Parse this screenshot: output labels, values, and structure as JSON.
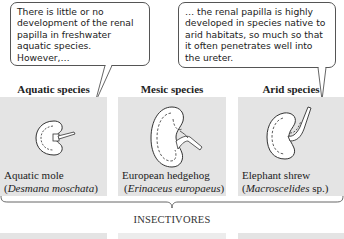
{
  "callouts": [
    {
      "text": "There is little or no development of the renal papilla in freshwater aquatic species.  However,…"
    },
    {
      "text": "… the renal papilla is highly developed in species native to arid habitats, so much so that it often penetrates well into the ureter."
    }
  ],
  "columns": [
    {
      "heading": "Aquatic species",
      "common_name": "Aquatic mole",
      "scientific_name": "Desmana moschata",
      "sci_suffix": ""
    },
    {
      "heading": "Mesic species",
      "common_name": "European hedgehog",
      "scientific_name": "Erinaceus europaeus",
      "sci_suffix": ""
    },
    {
      "heading": "Arid species",
      "common_name": "Elephant shrew",
      "scientific_name": "Macroscelides",
      "sci_suffix": " sp."
    }
  ],
  "group_label": "INSECTIVORES",
  "colors": {
    "panel": "#e4e4e4",
    "line": "#555555",
    "text": "#222222"
  }
}
